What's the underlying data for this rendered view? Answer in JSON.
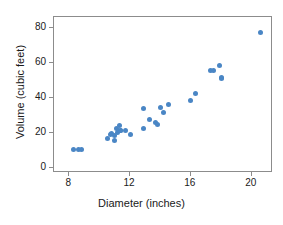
{
  "chart_data": {
    "type": "scatter",
    "title": "",
    "xlabel": "Diameter (inches)",
    "ylabel": "Volume (cubic feet)",
    "xlim": [
      7.0,
      21.4
    ],
    "ylim": [
      -3,
      86
    ],
    "xticks": [
      8,
      12,
      16,
      20
    ],
    "yticks": [
      0,
      20,
      40,
      60,
      80
    ],
    "xtick_labels": [
      "8",
      "12",
      "16",
      "20"
    ],
    "ytick_labels": [
      "0",
      "20",
      "40",
      "60",
      "80"
    ],
    "grid": false,
    "legend": null,
    "marker_color": "#4a86c5",
    "frame_color": "#8c8c8c",
    "background": "#ffffff",
    "n_points": 31,
    "series": [
      {
        "name": "trees",
        "x": [
          8.3,
          8.6,
          8.8,
          10.5,
          10.7,
          10.8,
          11.0,
          11.0,
          11.1,
          11.2,
          11.3,
          11.4,
          11.4,
          11.7,
          12.0,
          12.9,
          12.9,
          13.3,
          13.7,
          13.8,
          14.0,
          14.2,
          14.5,
          16.0,
          16.3,
          17.3,
          17.5,
          17.9,
          18.0,
          18.0,
          20.6
        ],
        "y": [
          10.3,
          10.3,
          10.2,
          16.4,
          18.8,
          19.7,
          15.6,
          18.2,
          22.6,
          19.9,
          24.2,
          21.0,
          21.4,
          21.3,
          19.1,
          22.2,
          33.8,
          27.4,
          25.7,
          24.9,
          34.5,
          31.7,
          36.3,
          38.3,
          42.6,
          55.4,
          55.7,
          58.3,
          51.5,
          51.0,
          77.0
        ]
      }
    ]
  },
  "axes": {
    "xlabel": "Diameter (inches)",
    "ylabel": "Volume (cubic feet)"
  }
}
